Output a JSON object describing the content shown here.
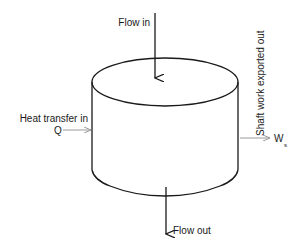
{
  "diagram": {
    "labels": {
      "flow_in": "Flow in",
      "flow_out": "Flow out",
      "heat_transfer": "Heat transfer in",
      "heat_symbol": "Q",
      "shaft_work": "Shaft work exported out",
      "work_symbol": "W",
      "work_subscript": "s"
    },
    "colors": {
      "stroke": "#1a1a1a",
      "secondary_arrow": "#9a9a9a",
      "background": "#ffffff"
    }
  }
}
